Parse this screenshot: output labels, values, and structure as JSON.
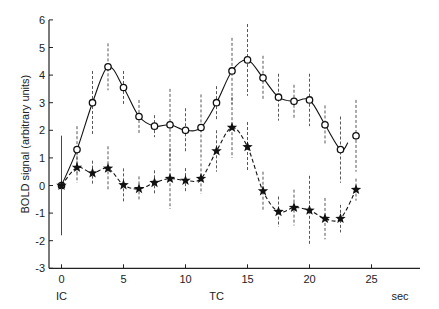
{
  "chart_data": {
    "type": "line",
    "title": "",
    "xlabel": "sec",
    "ylabel": "BOLD signal (arbitrary units)",
    "xlim": [
      -1.5,
      29
    ],
    "ylim": [
      -3,
      6
    ],
    "x_ticks": [
      0,
      5,
      10,
      15,
      20,
      25
    ],
    "y_ticks": [
      -3,
      -2,
      -1,
      0,
      1,
      2,
      3,
      4,
      5,
      6
    ],
    "x_annotations": [
      {
        "x": 0,
        "text": "IC"
      },
      {
        "x": 12.5,
        "text": "TC"
      }
    ],
    "grid": false,
    "legend": null,
    "x": [
      0,
      1.25,
      2.5,
      3.75,
      5,
      6.25,
      7.5,
      8.75,
      10,
      11.25,
      12.5,
      13.75,
      15,
      16.25,
      17.5,
      18.75,
      20,
      21.25,
      22.5,
      23.75
    ],
    "series": [
      {
        "name": "circles (solid line)",
        "marker": "circle",
        "line": "solid",
        "values": [
          0,
          1.3,
          3.0,
          4.3,
          3.55,
          2.5,
          2.15,
          2.2,
          2.0,
          2.1,
          3.0,
          4.15,
          4.55,
          3.9,
          3.2,
          3.05,
          3.1,
          2.2,
          1.3,
          1.8
        ],
        "err": [
          1.8,
          0.85,
          1.15,
          0.85,
          0.6,
          0.6,
          0.4,
          1.3,
          0.8,
          1.2,
          0.6,
          1.2,
          1.3,
          0.8,
          0.85,
          0.6,
          0.95,
          0.7,
          1.2,
          1.3
        ]
      },
      {
        "name": "stars (dashed line)",
        "marker": "star",
        "line": "dashed",
        "values": [
          0,
          0.65,
          0.45,
          0.62,
          0.02,
          -0.12,
          0.1,
          0.25,
          0.18,
          0.25,
          1.25,
          2.1,
          1.4,
          -0.2,
          -0.95,
          -0.8,
          -0.9,
          -1.2,
          -1.2,
          -0.15
        ],
        "err": [
          1.8,
          0.55,
          0.45,
          0.8,
          0.6,
          0.45,
          0.45,
          1.1,
          0.45,
          0.55,
          0.75,
          1.1,
          0.9,
          0.7,
          0.55,
          0.65,
          1.25,
          0.75,
          0.5,
          0.4
        ]
      }
    ]
  }
}
